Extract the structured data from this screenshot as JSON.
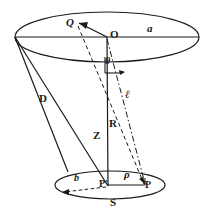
{
  "figure": {
    "kind": "geometry-diagram",
    "stroke_color": "#1a1a1a",
    "background_color": "#ffffff",
    "labels": {
      "q": "Q",
      "o": "O",
      "a": "a",
      "theta": "θ",
      "d": "D",
      "ell": "ℓ",
      "r": "R",
      "z": "Z",
      "b": "b",
      "p_prime": "P′",
      "rho": "ρ",
      "p": "P",
      "s": "S"
    },
    "geometry": {
      "top_ellipse": {
        "cx": 107,
        "cy": 37,
        "rx": 93,
        "ry": 25
      },
      "bottom_ellipse": {
        "cx": 110,
        "cy": 185,
        "rx": 55,
        "ry": 14
      },
      "apex_left": {
        "x": 15,
        "y": 37
      },
      "center_top": {
        "x": 107,
        "y": 37
      },
      "center_bottom": {
        "x": 110,
        "y": 185
      },
      "point_p": {
        "x": 144,
        "y": 185
      },
      "point_q": {
        "x": 76,
        "y": 30
      },
      "point_b_end": {
        "x": 62,
        "y": 190
      }
    }
  }
}
